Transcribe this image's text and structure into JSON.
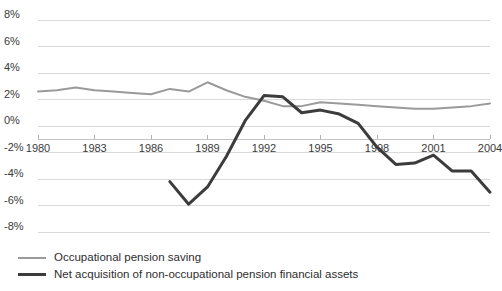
{
  "chart_data": {
    "type": "line",
    "title": "",
    "subtitle": "",
    "xlabel": "",
    "ylabel": "",
    "xlim": [
      1980,
      2004
    ],
    "ylim": [
      -8,
      8
    ],
    "ytick_values": [
      8,
      6,
      4,
      2,
      0,
      -2,
      -4,
      -6,
      -8
    ],
    "ytick_labels": [
      "8%",
      "6%",
      "4%",
      "2%",
      "0%",
      "-2%",
      "-4%",
      "-6%",
      "-8%"
    ],
    "xtick_values": [
      1980,
      1983,
      1986,
      1989,
      1992,
      1995,
      1998,
      2001,
      2004
    ],
    "xtick_labels": [
      "1980",
      "1983",
      "1986",
      "1989",
      "1992",
      "1995",
      "1998",
      "2001",
      "2004"
    ],
    "grid": true,
    "grid_color": "#d9d9d9",
    "axis_line_value": -1,
    "legend_position": "bottom-left",
    "series": [
      {
        "name": "Occupational pension saving",
        "color": "#9a9a9a",
        "width": 2,
        "x": [
          1980,
          1981,
          1982,
          1983,
          1984,
          1985,
          1986,
          1987,
          1988,
          1989,
          1990,
          1991,
          1992,
          1993,
          1994,
          1995,
          1996,
          1997,
          1998,
          1999,
          2000,
          2001,
          2002,
          2003,
          2004
        ],
        "values": [
          2.6,
          2.7,
          2.9,
          2.7,
          2.6,
          2.5,
          2.4,
          2.8,
          2.6,
          3.3,
          2.7,
          2.2,
          1.9,
          1.5,
          1.5,
          1.8,
          1.7,
          1.6,
          1.5,
          1.4,
          1.3,
          1.3,
          1.4,
          1.5,
          1.7
        ]
      },
      {
        "name": "Net acquisition of non-occupational pension financial assets",
        "color": "#3c3c3c",
        "width": 3,
        "x": [
          1987,
          1988,
          1989,
          1990,
          1991,
          1992,
          1993,
          1994,
          1995,
          1996,
          1997,
          1998,
          1999,
          2000,
          2001,
          2002,
          2003,
          2004
        ],
        "values": [
          -4.2,
          -5.9,
          -4.6,
          -2.3,
          0.4,
          2.3,
          2.2,
          1.0,
          1.2,
          0.9,
          0.2,
          -1.6,
          -2.9,
          -2.8,
          -2.2,
          -3.4,
          -3.4,
          -5.0
        ]
      }
    ]
  },
  "legend": {
    "items": [
      {
        "label": "Occupational pension saving"
      },
      {
        "label": "Net acquisition of non-occupational pension financial assets"
      }
    ]
  }
}
